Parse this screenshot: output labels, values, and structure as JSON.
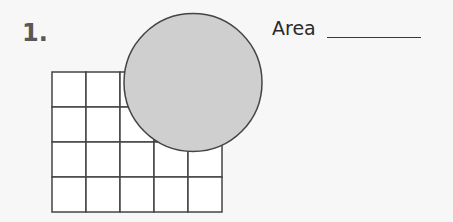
{
  "problem": {
    "number": "1.",
    "answer_label": "Area",
    "answer_value": ""
  },
  "figure": {
    "grid": {
      "x": 52,
      "y": 72,
      "cols": 5,
      "rows": 4,
      "cell_w": 34,
      "cell_h": 35
    },
    "circle": {
      "cx": 193,
      "cy": 82.5,
      "r": 69,
      "fill": "#cfcfcf",
      "stroke": "#444444"
    },
    "line_color": "#444444"
  }
}
